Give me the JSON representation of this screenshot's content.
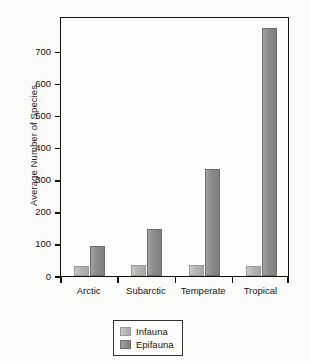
{
  "chart_data": {
    "type": "bar",
    "title": "",
    "xlabel": "",
    "ylabel": "Average Number of Species",
    "categories": [
      "Arctic",
      "Subarctic",
      "Temperate",
      "Tropical"
    ],
    "series": [
      {
        "name": "Infauna",
        "values": [
          31,
          33,
          34,
          32
        ]
      },
      {
        "name": "Epifauna",
        "values": [
          93,
          146,
          333,
          772
        ]
      }
    ],
    "ylim": [
      0,
      810
    ],
    "yticks": [
      0,
      100,
      200,
      300,
      400,
      500,
      600,
      700
    ],
    "ytick_labels": [
      "0",
      "100",
      "200",
      "300",
      "400",
      "500",
      "600",
      "700"
    ],
    "grid": false,
    "legend_position": "bottom-center",
    "colors": {
      "infauna": "#b4b4b4",
      "epifauna": "#8c8c8c",
      "axis": "#111111",
      "text": "#151515",
      "background": "#fbfbfa"
    }
  },
  "legend": {
    "entries": [
      {
        "label": "Infauna"
      },
      {
        "label": "Epifauna"
      }
    ]
  }
}
